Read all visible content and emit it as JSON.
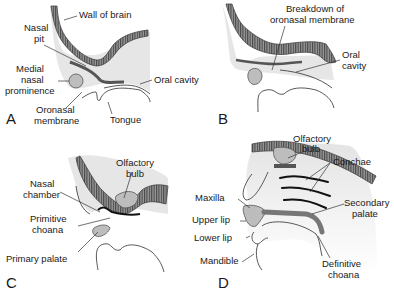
{
  "figure": {
    "panels": [
      {
        "id": "A",
        "letter": "A",
        "labels": {
          "wall_of_brain": "Wall of brain",
          "nasal_pit_1": "Nasal",
          "nasal_pit_2": "pit",
          "medial_1": "Medial",
          "medial_2": "nasal",
          "medial_3": "prominence",
          "oral_cavity": "Oral cavity",
          "oronasal_1": "Oronasal",
          "oronasal_2": "membrane",
          "tongue": "Tongue"
        }
      },
      {
        "id": "B",
        "letter": "B",
        "labels": {
          "breakdown_1": "Breakdown of",
          "breakdown_2": "oronasal membrane",
          "oral_1": "Oral",
          "oral_2": "cavity"
        }
      },
      {
        "id": "C",
        "letter": "C",
        "labels": {
          "olfactory_1": "Olfactory",
          "olfactory_2": "bulb",
          "nasal_chamber_1": "Nasal",
          "nasal_chamber_2": "chamber",
          "primitive_1": "Primitive",
          "primitive_2": "choana",
          "primary_palate": "Primary palate"
        }
      },
      {
        "id": "D",
        "letter": "D",
        "labels": {
          "olfactory_1": "Olfactory",
          "olfactory_2": "bulb",
          "conchae": "Conchae",
          "maxilla": "Maxilla",
          "secondary_1": "Secondary",
          "secondary_2": "palate",
          "upper_lip": "Upper lip",
          "lower_lip": "Lower lip",
          "mandible": "Mandible",
          "definitive_1": "Definitive",
          "definitive_2": "choana"
        }
      }
    ]
  }
}
